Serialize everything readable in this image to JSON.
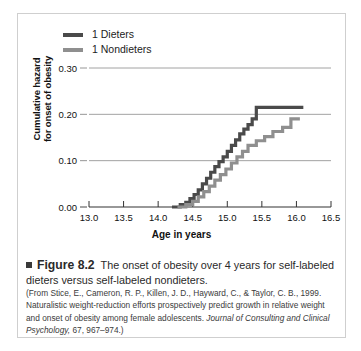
{
  "figure": {
    "marker_icon": "square-bullet-icon",
    "number_label": "Figure 8.2",
    "caption_text": "The onset of obesity over 4 years for self-labeled dieters versus self-labeled nondieters.",
    "citation_part1": "(From Stice, E., Cameron, R. P., Killen, J. D., Hayward, C., & Taylor, C. B., 1999. Naturalistic weight-reduction efforts prospectively predict growth in relative weight and onset of obesity among female adolescents. ",
    "citation_journal": "Journal of Consulting and Clinical Psychology,",
    "citation_part2": " 67, 967–974.)"
  },
  "colors": {
    "dieters": "#4a4a4a",
    "nondieters": "#8f8f8f",
    "gridline": "#8a8a8a",
    "axis": "#333333",
    "border": "#cfcfcf",
    "text": "#111111"
  },
  "chart_data": {
    "type": "line",
    "subtype": "step-cumulative-hazard",
    "title": "",
    "xlabel": "Age in years",
    "ylabel": "Cumulative hazard for onset of obesity",
    "xlim": [
      13.0,
      16.5
    ],
    "ylim": [
      0.0,
      0.3
    ],
    "xticks": [
      "13.0",
      "13.5",
      "14.0",
      "14.5",
      "15.0",
      "15.5",
      "16.0",
      "16.5"
    ],
    "xtick_values": [
      13.0,
      13.5,
      14.0,
      14.5,
      15.0,
      15.5,
      16.0,
      16.5
    ],
    "yticks": [
      "0.00",
      "0.10",
      "0.20",
      "0.30"
    ],
    "ytick_values": [
      0.0,
      0.1,
      0.2,
      0.3
    ],
    "grid": "horizontal",
    "legend_position": "top-left",
    "series": [
      {
        "name": "1 Dieters",
        "color": "#4a4a4a",
        "x": [
          14.2,
          14.32,
          14.4,
          14.46,
          14.52,
          14.58,
          14.64,
          14.7,
          14.76,
          14.82,
          14.88,
          14.94,
          15.0,
          15.06,
          15.12,
          15.18,
          15.24,
          15.3,
          15.36,
          15.42,
          16.1
        ],
        "values": [
          0.0,
          0.005,
          0.01,
          0.018,
          0.027,
          0.037,
          0.05,
          0.062,
          0.075,
          0.087,
          0.098,
          0.108,
          0.12,
          0.133,
          0.145,
          0.158,
          0.168,
          0.178,
          0.19,
          0.215,
          0.215
        ]
      },
      {
        "name": "1 Nondieters",
        "color": "#8f8f8f",
        "x": [
          14.28,
          14.4,
          14.5,
          14.58,
          14.66,
          14.74,
          14.82,
          14.9,
          14.98,
          15.06,
          15.14,
          15.22,
          15.3,
          15.42,
          15.54,
          15.66,
          15.8,
          15.92,
          16.05
        ],
        "values": [
          0.0,
          0.005,
          0.012,
          0.022,
          0.033,
          0.045,
          0.058,
          0.07,
          0.082,
          0.095,
          0.108,
          0.12,
          0.133,
          0.143,
          0.152,
          0.163,
          0.172,
          0.19,
          0.19
        ]
      }
    ]
  },
  "legend": {
    "items": [
      {
        "label": "1 Dieters",
        "color": "#4a4a4a"
      },
      {
        "label": "1 Nondieters",
        "color": "#8f8f8f"
      }
    ]
  }
}
